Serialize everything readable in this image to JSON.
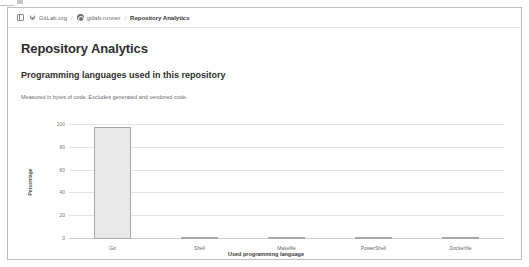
{
  "breadcrumb": {
    "toggle_icon": "sidebar-toggle-icon",
    "org_icon": "gitlab-tanuki-icon",
    "org": "GitLab.org",
    "separator": "/",
    "project_icon": "project-avatar-icon",
    "project": "gitlab-runner",
    "current": "Repository Analytics"
  },
  "page": {
    "title": "Repository Analytics",
    "section_title": "Programming languages used in this repository",
    "section_desc": "Measured in bytes of code. Excludes generated and vendored code."
  },
  "chart_data": {
    "type": "bar",
    "title": "Programming languages used in this repository",
    "xlabel": "Used programming language",
    "ylabel": "Percentage",
    "categories": [
      "Go",
      "Shell",
      "Makefile",
      "PowerShell",
      "Dockerfile"
    ],
    "values": [
      98.0,
      1.0,
      0.8,
      0.2,
      0.1
    ],
    "yticks": [
      "0",
      "20",
      "40",
      "60",
      "80",
      "100"
    ],
    "ytick_values": [
      0,
      20,
      40,
      60,
      80,
      100
    ],
    "ylim": [
      0,
      100
    ],
    "grid": true,
    "legend": false,
    "bar_fill": "#e8e8e8",
    "bar_stroke": "#a8a8a8"
  }
}
